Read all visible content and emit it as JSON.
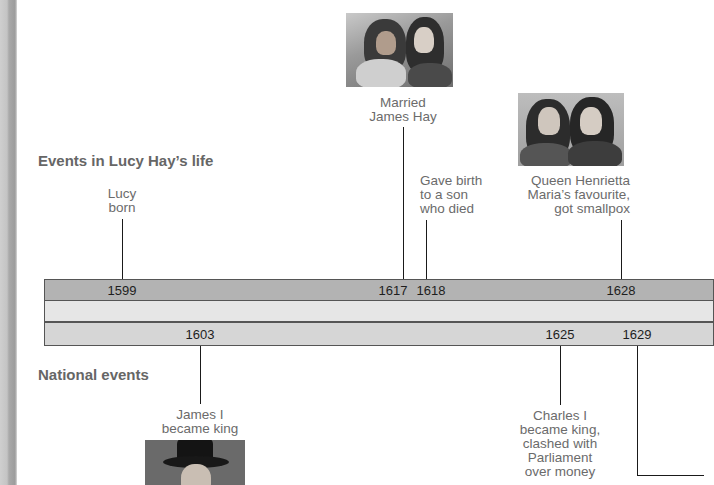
{
  "headings": {
    "lucy": "Events in Lucy Hay’s life",
    "national": "National events"
  },
  "lucy_events": [
    {
      "year": "1599",
      "label_lines": [
        "Lucy",
        "born"
      ]
    },
    {
      "year": "1617",
      "label_lines": [
        "Married",
        "James Hay"
      ]
    },
    {
      "year": "1618",
      "label_lines": [
        "Gave birth",
        "to a son",
        "who died"
      ]
    },
    {
      "year": "1628",
      "label_lines": [
        "Queen Henrietta",
        "Maria’s favourite,",
        "got smallpox"
      ]
    }
  ],
  "national_events": [
    {
      "year": "1603",
      "label_lines": [
        "James I",
        "became king"
      ]
    },
    {
      "year": "1625",
      "label_lines": [
        "Charles I",
        "became king,",
        "clashed with",
        "Parliament",
        "over money"
      ]
    },
    {
      "year": "1629",
      "label_lines": []
    }
  ],
  "images": {
    "married_portrait": "portrait of James Hay and Lucy Hay",
    "henrietta_portrait": "portrait of two women",
    "james_portrait": "portrait of James I"
  },
  "colors": {
    "top_bar": "#b3b3b3",
    "middle_bar": "#e6e6e6",
    "bottom_bar": "#d6d6d6",
    "label_text": "#6b6b6b",
    "heading_text": "#666666"
  }
}
